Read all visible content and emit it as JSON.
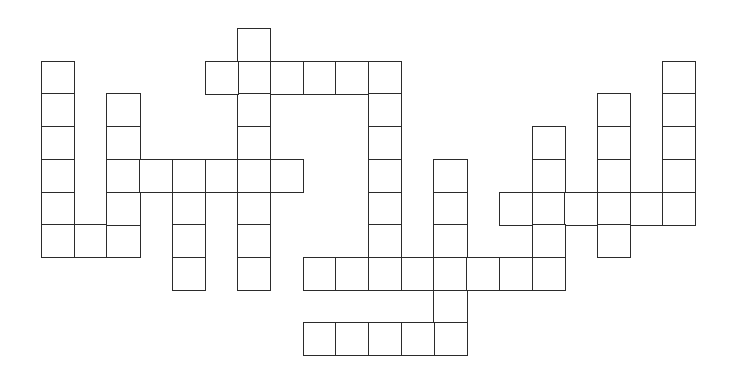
{
  "puzzle": {
    "type": "crossword-grid",
    "cell_size": 32.7,
    "origin_x": 41,
    "origin_y": 28,
    "line_color": "#2b2b2b",
    "background": "#ffffff",
    "cells": [
      [
        0,
        1
      ],
      [
        0,
        2
      ],
      [
        0,
        3
      ],
      [
        0,
        4
      ],
      [
        0,
        5
      ],
      [
        0,
        6
      ],
      [
        1,
        6
      ],
      [
        2,
        6
      ],
      [
        2,
        2
      ],
      [
        2,
        3
      ],
      [
        2,
        4
      ],
      [
        2,
        5
      ],
      [
        3,
        4
      ],
      [
        4,
        4
      ],
      [
        5,
        4
      ],
      [
        6,
        4
      ],
      [
        7,
        4
      ],
      [
        4,
        5
      ],
      [
        4,
        6
      ],
      [
        4,
        7
      ],
      [
        6,
        0
      ],
      [
        6,
        1
      ],
      [
        6,
        2
      ],
      [
        6,
        3
      ],
      [
        6,
        5
      ],
      [
        6,
        6
      ],
      [
        6,
        7
      ],
      [
        5,
        1
      ],
      [
        7,
        1
      ],
      [
        8,
        1
      ],
      [
        9,
        1
      ],
      [
        10,
        1
      ],
      [
        10,
        2
      ],
      [
        10,
        3
      ],
      [
        10,
        4
      ],
      [
        10,
        5
      ],
      [
        10,
        6
      ],
      [
        10,
        7
      ],
      [
        8,
        7
      ],
      [
        9,
        7
      ],
      [
        11,
        7
      ],
      [
        12,
        7
      ],
      [
        13,
        7
      ],
      [
        14,
        7
      ],
      [
        15,
        7
      ],
      [
        12,
        4
      ],
      [
        12,
        5
      ],
      [
        12,
        6
      ],
      [
        12,
        8
      ],
      [
        12,
        9
      ],
      [
        8,
        9
      ],
      [
        9,
        9
      ],
      [
        10,
        9
      ],
      [
        11,
        9
      ],
      [
        14,
        5
      ],
      [
        15,
        5
      ],
      [
        16,
        5
      ],
      [
        17,
        5
      ],
      [
        18,
        5
      ],
      [
        19,
        5
      ],
      [
        15,
        3
      ],
      [
        15,
        4
      ],
      [
        15,
        6
      ],
      [
        17,
        2
      ],
      [
        17,
        3
      ],
      [
        17,
        4
      ],
      [
        17,
        6
      ],
      [
        19,
        1
      ],
      [
        19,
        2
      ],
      [
        19,
        3
      ],
      [
        19,
        4
      ]
    ]
  }
}
